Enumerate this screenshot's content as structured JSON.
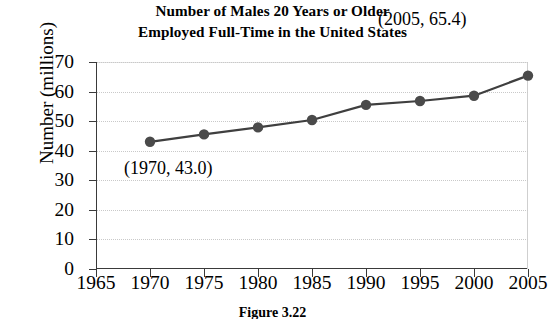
{
  "chart_data": {
    "type": "line",
    "title": "Number of Males 20 Years or Older Employed Full-Time in the United States",
    "title_lines": [
      "Number of Males 20 Years or Older",
      "Employed Full-Time in the United States"
    ],
    "xlabel": "",
    "ylabel": "Number (millions)",
    "x": [
      1970,
      1975,
      1980,
      1985,
      1990,
      1995,
      2000,
      2005
    ],
    "values": [
      43.0,
      45.5,
      47.9,
      50.4,
      55.5,
      56.8,
      58.6,
      65.4
    ],
    "xlim": [
      1965,
      2005
    ],
    "ylim": [
      0,
      70
    ],
    "xticks": [
      "1965",
      "1970",
      "1975",
      "1980",
      "1985",
      "1990",
      "1995",
      "2000",
      "2005"
    ],
    "xtick_values": [
      1965,
      1970,
      1975,
      1980,
      1985,
      1990,
      1995,
      2000,
      2005
    ],
    "yticks": [
      "0",
      "10",
      "20",
      "30",
      "40",
      "50",
      "60",
      "70"
    ],
    "ytick_values": [
      0,
      10,
      20,
      30,
      40,
      50,
      60,
      70
    ],
    "grid": "horizontal-dotted",
    "legend": "none",
    "series_color": "#3f3f3f",
    "marker_color": "#4a4a4a",
    "grid_color": "#c9c9c9",
    "annotations": [
      {
        "label": "(1970, 43.0)",
        "x": 1970,
        "y": 43.0
      },
      {
        "label": "(2005, 65.4)",
        "x": 2005,
        "y": 65.4
      }
    ]
  },
  "figure": {
    "caption": "Figure 3.22"
  }
}
